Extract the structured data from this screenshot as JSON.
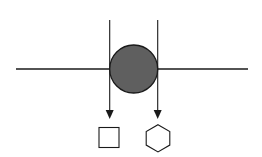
{
  "diagram": {
    "colors": {
      "background": "#ffffff",
      "stroke": "#1a1a1a",
      "circle_fill": "#5f5f5f"
    },
    "horizontal_line": {
      "x1": 16,
      "y1": 69,
      "x2": 248,
      "y2": 69
    },
    "circle": {
      "cx": 133.7,
      "cy": 69,
      "r": 24
    },
    "arrows": [
      {
        "name": "left-arrow",
        "x": 109.7,
        "y1": 20,
        "y2": 119
      },
      {
        "name": "right-arrow",
        "x": 157.7,
        "y1": 20,
        "y2": 119
      }
    ],
    "shapes": [
      {
        "type": "square",
        "x": 99,
        "y": 127,
        "w": 20,
        "h": 20
      },
      {
        "type": "hexagon",
        "cx": 158,
        "cy": 138.3,
        "r": 13.6
      }
    ]
  }
}
